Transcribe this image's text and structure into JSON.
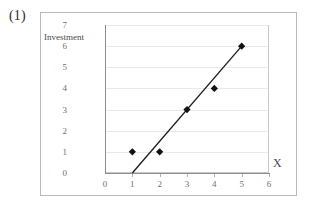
{
  "figure": {
    "label": "(1)"
  },
  "chart_data": {
    "type": "scatter",
    "title": "",
    "xlabel": "X",
    "ylabel": "Investment",
    "xlim": [
      0,
      6
    ],
    "ylim": [
      0,
      7
    ],
    "x_ticks": [
      "0",
      "1",
      "2",
      "3",
      "4",
      "5",
      "6"
    ],
    "y_ticks": [
      "0",
      "1",
      "2",
      "3",
      "4",
      "5",
      "6",
      "7"
    ],
    "grid": "horizontal",
    "legend": "none",
    "points": [
      {
        "x": 1,
        "y": 1
      },
      {
        "x": 2,
        "y": 1
      },
      {
        "x": 3,
        "y": 3
      },
      {
        "x": 4,
        "y": 4
      },
      {
        "x": 5,
        "y": 6
      }
    ],
    "trendline": {
      "x0": 1,
      "y0": 0,
      "x1": 5,
      "y1": 6
    },
    "marker": "diamond",
    "marker_color": "#111111",
    "line_color": "#1a1a1a",
    "grid_color": "#e9e9e9",
    "axis_color": "#8e8e8e",
    "background": "#ffffff"
  }
}
